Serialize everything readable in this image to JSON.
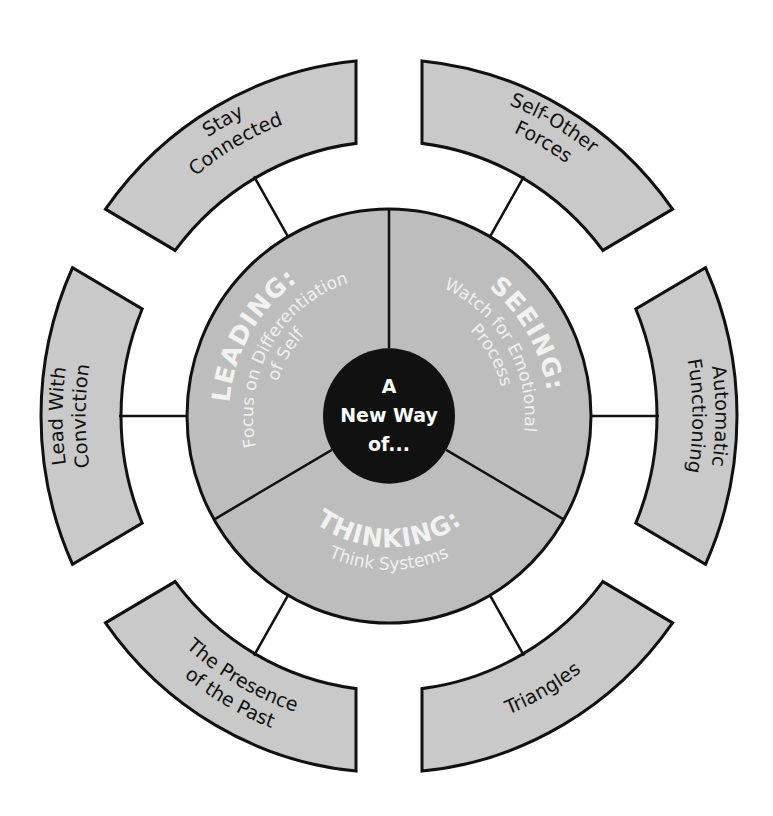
{
  "diagram": {
    "center": {
      "label_lines": [
        "A",
        "New Way",
        "of..."
      ],
      "color": "#111111"
    },
    "inner_sections": [
      {
        "id": "leading",
        "title": "LEADING:",
        "subtitle_lines": [
          "Focus on Differentiation",
          "of Self"
        ],
        "angle": 300
      },
      {
        "id": "seeing",
        "title": "SEEING:",
        "subtitle_lines": [
          "Watch for Emotional",
          "Process"
        ],
        "angle": 60
      },
      {
        "id": "thinking",
        "title": "THINKING:",
        "subtitle_lines": [
          "Think Systems"
        ],
        "angle": 180
      }
    ],
    "outer_segments": [
      {
        "id": "stay-connected",
        "label_lines": [
          "Stay",
          "Connected"
        ],
        "angle": 330
      },
      {
        "id": "self-other-forces",
        "label_lines": [
          "Self-Other",
          "Forces"
        ],
        "angle": 30
      },
      {
        "id": "automatic-functioning",
        "label_lines": [
          "Automatic",
          "Functioning"
        ],
        "angle": 90
      },
      {
        "id": "triangles",
        "label_lines": [
          "Triangles"
        ],
        "angle": 150
      },
      {
        "id": "presence-of-the-past",
        "label_lines": [
          "The Presence",
          "of the Past"
        ],
        "angle": 210
      },
      {
        "id": "lead-with-conviction",
        "label_lines": [
          "Lead With",
          "Conviction"
        ],
        "angle": 270
      }
    ],
    "colors": {
      "segment_fill": "#c9c9c9",
      "inner_fill": "#bdbdbd",
      "stroke": "#111111",
      "inner_text": "#f2f2f2"
    }
  }
}
